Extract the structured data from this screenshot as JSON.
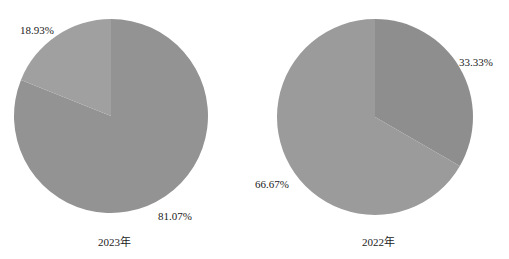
{
  "chart_data": [
    {
      "type": "pie",
      "title": "2023年",
      "categories": [
        "Slice A",
        "Slice B"
      ],
      "values": [
        81.07,
        18.93
      ],
      "labels": [
        "81.07%",
        "18.93%"
      ],
      "colors": [
        "#939393",
        "#a0a0a0"
      ],
      "start_angle_deg": 0,
      "legend": "none"
    },
    {
      "type": "pie",
      "title": "2022年",
      "categories": [
        "Slice A",
        "Slice B"
      ],
      "values": [
        66.67,
        33.33
      ],
      "labels": [
        "66.67%",
        "33.33%"
      ],
      "colors": [
        "#9b9b9b",
        "#8e8e8e"
      ],
      "start_angle_deg": 0,
      "legend": "none"
    }
  ],
  "charts": {
    "left": {
      "caption": "2023年",
      "big_label": "81.07%",
      "small_label": "18.93%"
    },
    "right": {
      "caption": "2022年",
      "big_label": "66.67%",
      "small_label": "33.33%"
    }
  }
}
